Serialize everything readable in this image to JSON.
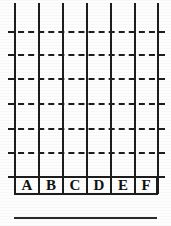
{
  "figure": {
    "type": "scanned-grid-diagram",
    "width": 171,
    "height": 226,
    "background_color": "#fdfdfd",
    "ink_color": "#1d1d1d",
    "rule_color": "#2a2a2a"
  },
  "grid": {
    "vertical_line_count": 7,
    "vertical_line_x": [
      14,
      38,
      62,
      86,
      110,
      134,
      157
    ],
    "vertical_line_top": 3,
    "vertical_line_bottom": 194,
    "horizontal_dash_count": 7,
    "horizontal_dash_y": [
      31,
      54,
      78,
      103,
      128,
      152,
      176
    ],
    "horizontal_dash_left": 8,
    "horizontal_dash_right": 165,
    "column_count": 6,
    "column_width": 24,
    "dash_pattern": "dashed"
  },
  "labels": {
    "row_top": 176,
    "row_left": 14,
    "row_height": 19,
    "cell_width": 24,
    "cells": [
      {
        "text": "A"
      },
      {
        "text": "B"
      },
      {
        "text": "C"
      },
      {
        "text": "D"
      },
      {
        "text": "E"
      },
      {
        "text": "F"
      }
    ]
  },
  "bottom_rule": {
    "y": 217,
    "left": 14,
    "right": 157,
    "thickness": 2
  }
}
